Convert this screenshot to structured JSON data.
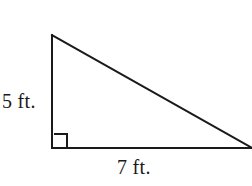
{
  "figure": {
    "type": "right-triangle-diagram",
    "background_color": "#ffffff",
    "stroke_color": "#1a1a1a",
    "stroke_width": 2,
    "labels": {
      "vertical_leg": "5 ft.",
      "horizontal_leg": "7 ft."
    },
    "geometry": {
      "apex": {
        "x": 52,
        "y": 35
      },
      "right_angle_vertex": {
        "x": 52,
        "y": 148
      },
      "base_right_vertex": {
        "x": 252,
        "y": 148
      },
      "right_angle_marker": {
        "x": 54,
        "y": 134,
        "size": 13
      }
    },
    "measurements": {
      "vertical_leg_value": 5,
      "horizontal_leg_value": 7,
      "units": "ft."
    }
  }
}
